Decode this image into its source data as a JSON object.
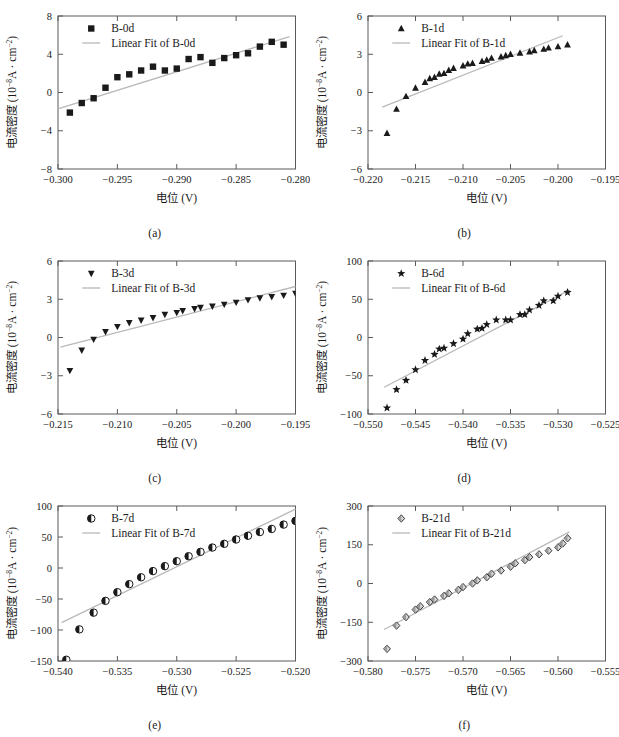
{
  "figure": {
    "axis_labels": {
      "x": "电位 (V)",
      "y_prefix": "电流密度 (10",
      "y_exp1": "-8",
      "y_mid": "A · cm",
      "y_exp2": "-2",
      "y_suffix": ")"
    },
    "legend_fit_prefix": "Linear Fit of ",
    "colors": {
      "marker": "#1a1a1a",
      "fit_line": "#b9b9b9",
      "axis": "#5a5a5a",
      "text": "#1a1a1a"
    }
  },
  "chart_data": [
    {
      "type": "scatter",
      "panel": "(a)",
      "series_name": "B-0d",
      "fit_label": "Linear Fit of B-0d",
      "marker": "square",
      "title": "",
      "xlabel": "电位 (V)",
      "ylabel": "电流密度 (10-8A · cm-2)",
      "xlim": [
        -0.3,
        -0.28
      ],
      "ylim": [
        -8,
        8
      ],
      "xticks": [
        -0.3,
        -0.295,
        -0.29,
        -0.285,
        -0.28
      ],
      "xticklabels": [
        "-0.300",
        "-0.295",
        "-0.290",
        "-0.285",
        "-0.280"
      ],
      "yticks": [
        -8,
        -4,
        0,
        4,
        8
      ],
      "yticklabels": [
        "-8",
        "-4",
        "0",
        "4",
        "8"
      ],
      "x": [
        -0.299,
        -0.298,
        -0.297,
        -0.296,
        -0.295,
        -0.294,
        -0.293,
        -0.292,
        -0.291,
        -0.29,
        -0.289,
        -0.288,
        -0.287,
        -0.286,
        -0.285,
        -0.284,
        -0.283,
        -0.282,
        -0.281
      ],
      "y": [
        -2.1,
        -1.1,
        -0.6,
        0.5,
        1.6,
        1.9,
        2.3,
        2.7,
        2.3,
        2.5,
        3.5,
        3.7,
        3.1,
        3.6,
        3.9,
        4.1,
        4.8,
        5.3,
        5.0
      ],
      "fit_x": [
        -0.3,
        -0.2805
      ],
      "fit_y": [
        -1.7,
        5.85
      ]
    },
    {
      "type": "scatter",
      "panel": "(b)",
      "series_name": "B-1d",
      "fit_label": "Linear Fit of B-1d",
      "marker": "triangle-up",
      "title": "",
      "xlabel": "电位 (V)",
      "ylabel": "电流密度 (10-8A · cm-2)",
      "xlim": [
        -0.22,
        -0.195
      ],
      "ylim": [
        -6,
        6
      ],
      "xticks": [
        -0.22,
        -0.215,
        -0.21,
        -0.205,
        -0.2,
        -0.195
      ],
      "xticklabels": [
        "-0.220",
        "-0.215",
        "-0.210",
        "-0.205",
        "-0.200",
        "-0.195"
      ],
      "yticks": [
        -6,
        -3,
        0,
        3,
        6
      ],
      "yticklabels": [
        "-6",
        "-3",
        "0",
        "3",
        "6"
      ],
      "x": [
        -0.218,
        -0.217,
        -0.216,
        -0.215,
        -0.214,
        -0.2135,
        -0.213,
        -0.2125,
        -0.212,
        -0.2115,
        -0.211,
        -0.21,
        -0.2095,
        -0.209,
        -0.208,
        -0.2075,
        -0.207,
        -0.206,
        -0.2055,
        -0.205,
        -0.204,
        -0.203,
        -0.2025,
        -0.2015,
        -0.201,
        -0.2,
        -0.199
      ],
      "y": [
        -3.2,
        -1.3,
        -0.3,
        0.35,
        0.8,
        1.1,
        1.2,
        1.45,
        1.5,
        1.75,
        1.9,
        2.1,
        2.25,
        2.3,
        2.45,
        2.55,
        2.7,
        2.8,
        2.9,
        3.0,
        3.1,
        3.2,
        3.3,
        3.4,
        3.5,
        3.6,
        3.75
      ],
      "fit_x": [
        -0.2185,
        -0.1995
      ],
      "fit_y": [
        -1.15,
        4.45
      ]
    },
    {
      "type": "scatter",
      "panel": "(c)",
      "series_name": "B-3d",
      "fit_label": "Linear Fit of B-3d",
      "marker": "triangle-down",
      "title": "",
      "xlabel": "电位 (V)",
      "ylabel": "电流密度 (10-8A · cm-2)",
      "xlim": [
        -0.215,
        -0.195
      ],
      "ylim": [
        -6,
        6
      ],
      "xticks": [
        -0.215,
        -0.21,
        -0.205,
        -0.2,
        -0.195
      ],
      "xticklabels": [
        "-0.215",
        "-0.210",
        "-0.205",
        "-0.200",
        "-0.195"
      ],
      "yticks": [
        -6,
        -3,
        0,
        3,
        6
      ],
      "yticklabels": [
        "-6",
        "-3",
        "0",
        "3",
        "6"
      ],
      "x": [
        -0.214,
        -0.213,
        -0.212,
        -0.211,
        -0.21,
        -0.209,
        -0.208,
        -0.207,
        -0.206,
        -0.205,
        -0.2045,
        -0.2035,
        -0.203,
        -0.202,
        -0.201,
        -0.2,
        -0.199,
        -0.198,
        -0.197,
        -0.196,
        -0.195
      ],
      "y": [
        -2.6,
        -1.0,
        -0.15,
        0.45,
        0.85,
        1.15,
        1.35,
        1.55,
        1.8,
        1.95,
        2.1,
        2.25,
        2.35,
        2.45,
        2.6,
        2.75,
        2.95,
        3.1,
        3.2,
        3.3,
        3.45
      ],
      "fit_x": [
        -0.2148,
        -0.195
      ],
      "fit_y": [
        -0.75,
        4.0
      ]
    },
    {
      "type": "scatter",
      "panel": "(d)",
      "series_name": "B-6d",
      "fit_label": "Linear Fit of B-6d",
      "marker": "star",
      "title": "",
      "xlabel": "电位 (V)",
      "ylabel": "电流密度 (10-8A · cm-2)",
      "xlim": [
        -0.55,
        -0.525
      ],
      "ylim": [
        -100,
        100
      ],
      "xticks": [
        -0.55,
        -0.545,
        -0.54,
        -0.535,
        -0.53,
        -0.525
      ],
      "xticklabels": [
        "-0.550",
        "-0.545",
        "-0.540",
        "-0.535",
        "-0.530",
        "-0.525"
      ],
      "yticks": [
        -100,
        -50,
        0,
        50,
        100
      ],
      "yticklabels": [
        "-100",
        "-50",
        "0",
        "50",
        "100"
      ],
      "x": [
        -0.548,
        -0.547,
        -0.546,
        -0.545,
        -0.544,
        -0.543,
        -0.5425,
        -0.542,
        -0.541,
        -0.54,
        -0.5395,
        -0.5385,
        -0.538,
        -0.5375,
        -0.5365,
        -0.5355,
        -0.535,
        -0.534,
        -0.5335,
        -0.533,
        -0.532,
        -0.5315,
        -0.5305,
        -0.53,
        -0.529
      ],
      "y": [
        -92,
        -68,
        -56,
        -42,
        -30,
        -22,
        -15,
        -14,
        -8,
        -2,
        5,
        11,
        12,
        17,
        23,
        23,
        23,
        30,
        30,
        36,
        42,
        48,
        48,
        54,
        59
      ],
      "fit_x": [
        -0.5483,
        -0.5288
      ],
      "fit_y": [
        -65,
        62
      ]
    },
    {
      "type": "scatter",
      "panel": "(e)",
      "series_name": "B-7d",
      "fit_label": "Linear Fit of B-7d",
      "marker": "half-circle",
      "title": "",
      "xlabel": "电位 (V)",
      "ylabel": "电流密度 (10-8A · cm-2)",
      "xlim": [
        -0.54,
        -0.52
      ],
      "ylim": [
        -150,
        100
      ],
      "xticks": [
        -0.54,
        -0.535,
        -0.53,
        -0.525,
        -0.52
      ],
      "xticklabels": [
        "-0.540",
        "-0.535",
        "-0.530",
        "-0.525",
        "-0.520"
      ],
      "yticks": [
        -150,
        -100,
        -50,
        0,
        50,
        100
      ],
      "yticklabels": [
        "-150",
        "-100",
        "-50",
        "0",
        "50",
        "100"
      ],
      "x": [
        -0.5393,
        -0.5382,
        -0.537,
        -0.536,
        -0.535,
        -0.534,
        -0.533,
        -0.532,
        -0.531,
        -0.53,
        -0.529,
        -0.528,
        -0.527,
        -0.526,
        -0.525,
        -0.524,
        -0.523,
        -0.522,
        -0.521,
        -0.52
      ],
      "y": [
        -148,
        -99,
        -72,
        -53,
        -39,
        -26,
        -15,
        -5,
        3,
        11,
        19,
        26,
        33,
        39,
        46,
        52,
        58,
        63,
        70,
        76
      ],
      "fit_x": [
        -0.5397,
        -0.52
      ],
      "fit_y": [
        -88,
        95
      ]
    },
    {
      "type": "scatter",
      "panel": "(f)",
      "series_name": "B-21d",
      "fit_label": "Linear Fit of B-21d",
      "marker": "diamond",
      "title": "",
      "xlabel": "电位 (V)",
      "ylabel": "电流密度 (10-8A · cm-2)",
      "xlim": [
        -0.58,
        -0.555
      ],
      "ylim": [
        -300,
        300
      ],
      "xticks": [
        -0.58,
        -0.575,
        -0.57,
        -0.565,
        -0.56,
        -0.555
      ],
      "xticklabels": [
        "-0.580",
        "-0.575",
        "-0.570",
        "-0.565",
        "-0.560",
        "-0.555"
      ],
      "yticks": [
        -300,
        -150,
        0,
        150,
        300
      ],
      "yticklabels": [
        "-300",
        "-150",
        "0",
        "150",
        "300"
      ],
      "x": [
        -0.578,
        -0.577,
        -0.576,
        -0.575,
        -0.5745,
        -0.5735,
        -0.573,
        -0.572,
        -0.5715,
        -0.5705,
        -0.57,
        -0.569,
        -0.5685,
        -0.5675,
        -0.567,
        -0.566,
        -0.565,
        -0.5645,
        -0.5635,
        -0.563,
        -0.562,
        -0.561,
        -0.56,
        -0.5595,
        -0.559
      ],
      "y": [
        -253,
        -163,
        -130,
        -101,
        -88,
        -72,
        -62,
        -48,
        -38,
        -25,
        -14,
        0,
        12,
        24,
        38,
        50,
        65,
        78,
        90,
        102,
        113,
        127,
        140,
        155,
        175
      ],
      "fit_x": [
        -0.5783,
        -0.5588
      ],
      "fit_y": [
        -178,
        200
      ]
    }
  ]
}
